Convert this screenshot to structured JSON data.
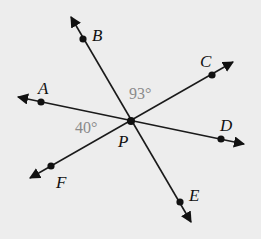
{
  "diagram": {
    "center": {
      "name": "P",
      "x": 131,
      "y": 121
    },
    "lines": [
      {
        "name": "line-BE",
        "from": [
          71,
          17
        ],
        "to": [
          191,
          222
        ]
      },
      {
        "name": "line-AD",
        "from": [
          18,
          97
        ],
        "to": [
          244,
          144
        ]
      },
      {
        "name": "line-CF",
        "from": [
          233,
          62
        ],
        "to": [
          30,
          178
        ]
      }
    ],
    "points": [
      {
        "label": "A",
        "x": 41,
        "y": 102,
        "lx": 38,
        "ly": 94
      },
      {
        "label": "B",
        "x": 83,
        "y": 39,
        "lx": 92,
        "ly": 41
      },
      {
        "label": "C",
        "x": 212,
        "y": 75,
        "lx": 200,
        "ly": 67
      },
      {
        "label": "D",
        "x": 221,
        "y": 139,
        "lx": 220,
        "ly": 131
      },
      {
        "label": "E",
        "x": 180,
        "y": 202,
        "lx": 189,
        "ly": 201
      },
      {
        "label": "F",
        "x": 51,
        "y": 166,
        "lx": 56,
        "ly": 188
      },
      {
        "label": "P",
        "x": 131,
        "y": 121,
        "lx": 118,
        "ly": 147
      }
    ],
    "angles": [
      {
        "text": "93°",
        "x": 129,
        "y": 99
      },
      {
        "text": "40°",
        "x": 75,
        "y": 133
      }
    ]
  }
}
